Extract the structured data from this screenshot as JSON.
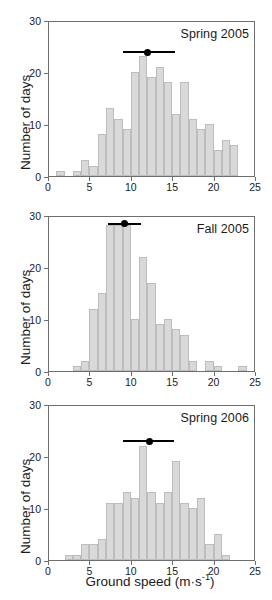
{
  "figure": {
    "xlabel": "Ground speed (m·s⁻¹)",
    "xlabel_main": "Ground speed (m·s",
    "xlabel_sup": "-1",
    "xlabel_close": ")",
    "ylabel": "Number of days",
    "bar_color": "#d9d9d9",
    "bar_border_color": "#bdbdbd",
    "axis_color": "#6e6e6e",
    "marker_color": "#000000"
  },
  "chart_data": [
    {
      "type": "bar",
      "title": "Spring 2005",
      "xlabel": "Ground speed (m·s⁻¹)",
      "ylabel": "Number of days",
      "xlim": [
        0,
        25
      ],
      "ylim": [
        0,
        30
      ],
      "xticks": [
        0,
        5,
        10,
        15,
        20,
        25
      ],
      "yticks": [
        0,
        10,
        20,
        30
      ],
      "grid": false,
      "bin_width": 1,
      "bin_starts": [
        1,
        3,
        4,
        5,
        6,
        7,
        8,
        9,
        10,
        11,
        12,
        13,
        14,
        15,
        16,
        17,
        18,
        19,
        20,
        21
      ],
      "values": [
        1,
        1,
        3,
        2,
        8,
        13,
        11,
        9,
        20,
        23,
        19,
        21,
        18,
        12,
        18,
        11,
        9,
        10,
        5,
        7
      ],
      "extra_bin_start": 22,
      "extra_value": 6,
      "mean_marker": {
        "mean": 12.0,
        "low": 9.0,
        "high": 15.3,
        "y": 24
      }
    },
    {
      "type": "bar",
      "title": "Fall 2005",
      "xlabel": "Ground speed (m·s⁻¹)",
      "ylabel": "Number of days",
      "xlim": [
        0,
        25
      ],
      "ylim": [
        0,
        30
      ],
      "xticks": [
        0,
        5,
        10,
        15,
        20,
        25
      ],
      "yticks": [
        0,
        10,
        20,
        30
      ],
      "grid": false,
      "bin_width": 1,
      "bin_starts": [
        3,
        4,
        5,
        6,
        7,
        8,
        9,
        10,
        11,
        12,
        13,
        14,
        15,
        16,
        17,
        19,
        20,
        23
      ],
      "values": [
        1,
        2,
        12,
        15,
        28,
        28,
        28,
        10,
        22,
        17,
        9,
        10,
        8,
        7,
        2,
        2,
        1,
        1
      ],
      "mean_marker": {
        "mean": 9.2,
        "low": 7.2,
        "high": 11.2,
        "y": 28.5
      }
    },
    {
      "type": "bar",
      "title": "Spring 2006",
      "xlabel": "Ground speed (m·s⁻¹)",
      "ylabel": "Number of days",
      "xlim": [
        0,
        25
      ],
      "ylim": [
        0,
        30
      ],
      "xticks": [
        0,
        5,
        10,
        15,
        20,
        25
      ],
      "yticks": [
        0,
        10,
        20,
        30
      ],
      "grid": false,
      "bin_width": 1,
      "bin_starts": [
        2,
        3,
        4,
        5,
        6,
        7,
        8,
        9,
        10,
        11,
        12,
        13,
        14,
        15,
        16,
        17,
        18,
        19,
        20,
        21
      ],
      "values": [
        1,
        1,
        3,
        3,
        4,
        11,
        11,
        13,
        12,
        22,
        13,
        11,
        13,
        19,
        11,
        10,
        12,
        3,
        5,
        1
      ],
      "extra_bin_start": 22,
      "extra_value": 0,
      "mean_marker": {
        "mean": 12.2,
        "low": 9.0,
        "high": 15.2,
        "y": 23
      }
    }
  ],
  "panels_layout": [
    {
      "top": 21,
      "height": 156
    },
    {
      "top": 216,
      "height": 156
    },
    {
      "top": 405,
      "height": 156
    }
  ]
}
